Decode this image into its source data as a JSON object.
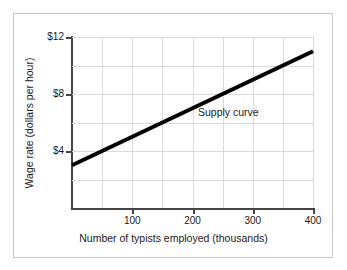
{
  "chart_data": {
    "type": "line",
    "title": "",
    "subtitle": "",
    "xlabel": "Number of typists employed (thousands)",
    "ylabel": "Wage rate (dollars per hour)",
    "xlim": [
      0,
      400
    ],
    "ylim": [
      0,
      12
    ],
    "xticks": [
      100,
      200,
      300,
      400
    ],
    "xtick_labels": [
      "100",
      "200",
      "300",
      "400"
    ],
    "yticks": [
      4,
      8,
      12
    ],
    "ytick_labels": [
      "$4",
      "$8",
      "$12"
    ],
    "x_gridlines": [
      50,
      100,
      150,
      200,
      250,
      300,
      350,
      400
    ],
    "y_gridlines": [
      2,
      4,
      6,
      8,
      10,
      12
    ],
    "grid": true,
    "legend": "none",
    "series": [
      {
        "name": "Supply curve",
        "color": "#000000",
        "linewidth": 4,
        "x": [
          0,
          400
        ],
        "values": [
          3.0,
          11.0
        ],
        "annotation": "Supply curve"
      }
    ],
    "colors": {
      "series": "#000000",
      "axis": "#444444",
      "grid": "#d9d9d9",
      "frame": "#c8c8c8",
      "text": "#1a1a1a",
      "background": "#ffffff"
    }
  }
}
